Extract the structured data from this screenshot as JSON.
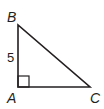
{
  "diagram": {
    "type": "right-triangle",
    "stroke_color": "#231f20",
    "background": "#ffffff",
    "vertices": {
      "B": {
        "label": "B",
        "x": 18,
        "y": 25
      },
      "A": {
        "label": "A",
        "x": 18,
        "y": 87
      },
      "C": {
        "label": "C",
        "x": 90,
        "y": 87
      }
    },
    "right_angle_at": "A",
    "side_labels": {
      "AB": "5"
    }
  }
}
